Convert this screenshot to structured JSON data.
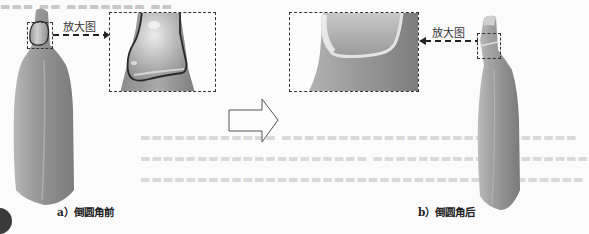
{
  "figure": {
    "left_panel": {
      "zoom_label": "放大图",
      "caption": "a）倒圆角前"
    },
    "right_panel": {
      "zoom_label": "放大图",
      "caption": "b）倒圆角后"
    },
    "transition_arrow": "hollow-right-arrow"
  },
  "colors": {
    "bottle_light": "#c9c9c9",
    "bottle_mid": "#9a9a9a",
    "bottle_dark": "#7c7c7c",
    "outline": "#333333",
    "background": "#fbfbfb"
  }
}
